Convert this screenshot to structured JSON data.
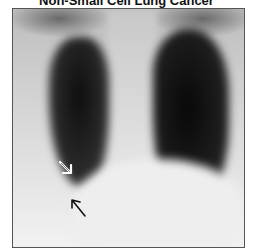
{
  "title": "Non-Small Cell Lung Cancer",
  "image": {
    "description": "Frontal chest radiograph",
    "annotations": [
      {
        "type": "open-arrow",
        "color": "#ffffff",
        "direction": "down-right"
      },
      {
        "type": "line-arrow",
        "color": "#111111",
        "direction": "up-left"
      }
    ]
  }
}
